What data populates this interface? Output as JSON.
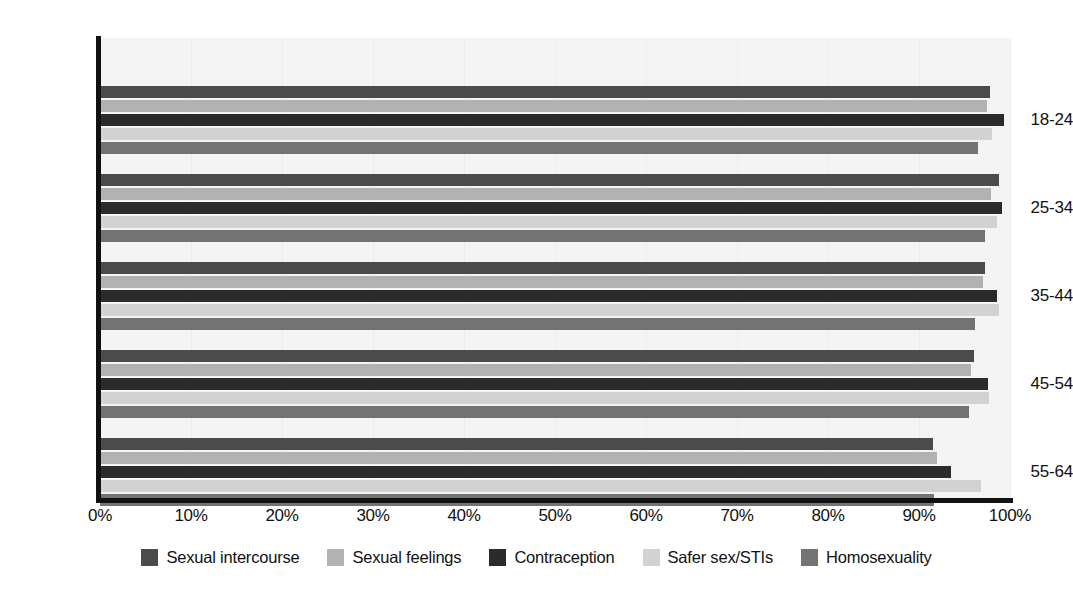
{
  "chart_data": {
    "type": "bar",
    "orientation": "horizontal",
    "title": "",
    "subtitle": "",
    "xlabel": "",
    "ylabel": "",
    "xlim": [
      0,
      100
    ],
    "xticks": [
      "0%",
      "10%",
      "20%",
      "30%",
      "40%",
      "50%",
      "60%",
      "70%",
      "80%",
      "90%",
      "100%"
    ],
    "xtick_values": [
      0,
      10,
      20,
      30,
      40,
      50,
      60,
      70,
      80,
      90,
      100
    ],
    "categories": [
      "18-24",
      "25-34",
      "35-44",
      "45-54",
      "55-64"
    ],
    "grid": true,
    "legend_position": "bottom",
    "series": [
      {
        "name": "Sexual intercourse",
        "color": "#4b4b4b",
        "values": [
          97.8,
          98.8,
          97.3,
          96.0,
          91.5
        ]
      },
      {
        "name": "Sexual feelings",
        "color": "#b2b2b2",
        "values": [
          97.5,
          97.9,
          97.0,
          95.7,
          92.0
        ]
      },
      {
        "name": "Contraception",
        "color": "#2b2b2b",
        "values": [
          99.3,
          99.1,
          98.6,
          97.6,
          93.5
        ]
      },
      {
        "name": "Safer sex/STIs",
        "color": "#d2d2d2",
        "values": [
          98.0,
          98.6,
          98.8,
          97.7,
          96.8
        ]
      },
      {
        "name": "Homosexuality",
        "color": "#737373",
        "values": [
          96.5,
          97.3,
          96.2,
          95.5,
          91.6
        ]
      }
    ]
  },
  "style": {
    "plot_background": "#f4f4f4",
    "axis_color": "#111111",
    "gridline_color": "#ececec",
    "page_background": "#ffffff"
  }
}
